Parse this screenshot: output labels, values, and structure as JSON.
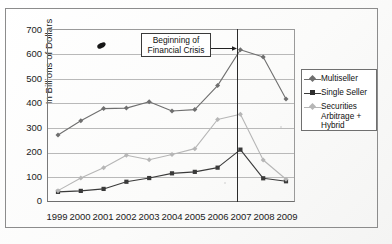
{
  "chart_data": {
    "type": "line",
    "title": "",
    "xlabel": "",
    "ylabel": "In Billions of Dollars",
    "categories": [
      "1999",
      "2000",
      "2001",
      "2002",
      "2003",
      "2004",
      "2005",
      "2006",
      "2007",
      "2008",
      "2009"
    ],
    "x": [
      1999,
      2000,
      2001,
      2002,
      2003,
      2004,
      2005,
      2006,
      2007,
      2008,
      2009
    ],
    "ylim": [
      0,
      700
    ],
    "ytick_labels": [
      "0",
      "100",
      "200",
      "300",
      "400",
      "500",
      "600",
      "700"
    ],
    "ytick_values": [
      0,
      100,
      200,
      300,
      400,
      500,
      600,
      700
    ],
    "grid": true,
    "legend_position": "right",
    "series": [
      {
        "name": "Multiseller",
        "marker": "diamond",
        "color": "#6f6f6f",
        "values": [
          275,
          333,
          382,
          384,
          410,
          372,
          378,
          475,
          620,
          591,
          421
        ]
      },
      {
        "name": "Single Seller",
        "marker": "square",
        "color": "#3a3a3a",
        "values": [
          45,
          49,
          57,
          86,
          101,
          120,
          126,
          143,
          216,
          100,
          88
        ]
      },
      {
        "name": "Securities Arbitrage + Hybrid",
        "marker": "diamond",
        "color": "#b6b6b6",
        "values": [
          50,
          101,
          143,
          193,
          175,
          196,
          220,
          338,
          359,
          174,
          96
        ]
      }
    ],
    "annotations": [
      {
        "name": "beginning-of-financial-crisis",
        "text_line1": "Beginning of",
        "text_line2": "Financial Crisis",
        "points_to_year": 2007,
        "marker_line": "vertical"
      }
    ]
  },
  "legend": {
    "items": [
      {
        "label": "Multiseller"
      },
      {
        "label": "Single Seller"
      },
      {
        "label": "Securities",
        "label2": "Arbitrage +",
        "label3": "Hybrid"
      }
    ]
  }
}
